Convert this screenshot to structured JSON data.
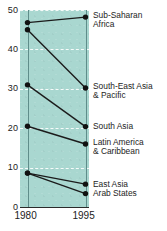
{
  "chart_data": {
    "type": "line",
    "subtype": "slope-chart",
    "title": "",
    "xlabel": "",
    "ylabel": "",
    "x": [
      "1980",
      "1995"
    ],
    "xtick_labels": [
      "1980",
      "1995"
    ],
    "ylim": [
      0,
      50
    ],
    "ytick_labels": [
      "0",
      "10",
      "20",
      "30",
      "40",
      "50"
    ],
    "ytick_values": [
      0,
      10,
      20,
      30,
      40,
      50
    ],
    "grid": "horizontal-dashed-white",
    "legend": "right-of-plot-inline",
    "plot_background": "#a9d7d0",
    "series": [
      {
        "name": "Sub-Saharan Africa",
        "label_lines": [
          "Sub-Saharan",
          "Africa"
        ],
        "values": [
          46.8,
          48.2
        ]
      },
      {
        "name": "South-East Asia & Pacific",
        "label_lines": [
          "South-East Asia",
          "& Pacific"
        ],
        "values": [
          45.0,
          30.2
        ]
      },
      {
        "name": "South Asia",
        "label_lines": [
          "South Asia"
        ],
        "values": [
          31.0,
          20.4
        ]
      },
      {
        "name": "Latin America & Caribbean",
        "label_lines": [
          "Latin America",
          "& Caribbean"
        ],
        "values": [
          20.5,
          16.0
        ]
      },
      {
        "name": "East Asia",
        "label_lines": [
          "East Asia"
        ],
        "values": [
          8.6,
          5.8
        ]
      },
      {
        "name": "Arab States",
        "label_lines": [
          "Arab States"
        ],
        "values": [
          8.6,
          3.4
        ]
      }
    ]
  },
  "colors": {
    "plot_band": "#a9d7d0",
    "gridline": "#ffffff",
    "axis": "#2b2b2b",
    "vertical_axis": "#5f8d8a",
    "marker": "#111111",
    "text": "#1d1d1d"
  },
  "labels": {
    "sub_saharan_africa": "Sub-Saharan Africa",
    "south_east_asia_pacific": "South-East Asia & Pacific",
    "south_asia": "South Asia",
    "latin_america_caribbean": "Latin America & Caribbean",
    "east_asia": "East Asia",
    "arab_states": "Arab States"
  }
}
